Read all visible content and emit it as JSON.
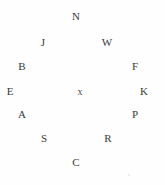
{
  "diagram": {
    "background_color": "#fefefe",
    "text_color": "#3a3a3a",
    "center": {
      "label": "x",
      "x": 80,
      "y": 92
    },
    "nodes": [
      {
        "label": "N",
        "x": 76,
        "y": 17,
        "position": "top"
      },
      {
        "label": "W",
        "x": 107,
        "y": 43,
        "position": "upper-right"
      },
      {
        "label": "F",
        "x": 135,
        "y": 67,
        "position": "right-upper"
      },
      {
        "label": "K",
        "x": 144,
        "y": 92,
        "position": "right"
      },
      {
        "label": "P",
        "x": 135,
        "y": 115,
        "position": "right-lower"
      },
      {
        "label": "R",
        "x": 108,
        "y": 139,
        "position": "lower-right"
      },
      {
        "label": "C",
        "x": 76,
        "y": 163,
        "position": "bottom"
      },
      {
        "label": "S",
        "x": 44,
        "y": 139,
        "position": "lower-left"
      },
      {
        "label": "A",
        "x": 22,
        "y": 115,
        "position": "left-lower"
      },
      {
        "label": "E",
        "x": 10,
        "y": 92,
        "position": "left"
      },
      {
        "label": "B",
        "x": 22,
        "y": 67,
        "position": "left-upper"
      },
      {
        "label": "J",
        "x": 43,
        "y": 43,
        "position": "upper-left"
      }
    ],
    "specks": [
      {
        "x": 128,
        "y": 174
      }
    ]
  }
}
